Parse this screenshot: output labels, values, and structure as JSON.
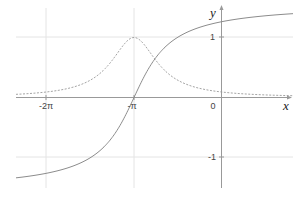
{
  "chart_data": {
    "type": "line",
    "title": "",
    "xlabel": "x",
    "ylabel": "y",
    "xlim": [
      -7.4,
      2.9
    ],
    "ylim": [
      -1.55,
      1.62
    ],
    "grid": true,
    "x_ticks": [
      {
        "value": -6.2832,
        "label": "-2π"
      },
      {
        "value": -3.1416,
        "label": "-π"
      },
      {
        "value": 0,
        "label": "0"
      }
    ],
    "y_ticks": [
      {
        "value": 1,
        "label": "1"
      },
      {
        "value": -1,
        "label": "-1"
      }
    ],
    "series": [
      {
        "name": "arctan(x+π)",
        "style": "solid",
        "color": "#888888",
        "x": [
          -7.4,
          -6.28,
          -5,
          -4,
          -3.14,
          -2.5,
          -2,
          -1,
          0,
          1,
          2,
          2.9
        ],
        "y": [
          -1.34,
          -1.26,
          -1.08,
          -0.71,
          0,
          0.57,
          0.85,
          1.14,
          1.26,
          1.33,
          1.38,
          1.4
        ]
      },
      {
        "name": "1/(1+(x+π)²)",
        "style": "dashed",
        "color": "#999999",
        "x": [
          -7.4,
          -6.28,
          -5,
          -4,
          -3.14,
          -2.5,
          -2,
          -1,
          0,
          1,
          2,
          2.9
        ],
        "y": [
          0.05,
          0.09,
          0.22,
          0.58,
          1.0,
          0.71,
          0.43,
          0.18,
          0.09,
          0.06,
          0.04,
          0.03
        ]
      }
    ]
  },
  "axes": {
    "x_label": "x",
    "y_label": "y"
  },
  "ticks": {
    "x_neg2pi": "-2π",
    "x_negpi": "-π",
    "x_zero": "0",
    "y_one": "1",
    "y_negone": "-1"
  }
}
